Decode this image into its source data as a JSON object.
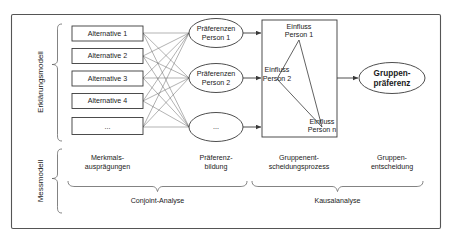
{
  "diagram": {
    "side_labels": {
      "explanation_model": "Erklärungsmodell",
      "measurement_model": "Messmodell"
    },
    "alternatives": [
      {
        "label": "Alternative 1"
      },
      {
        "label": "Alternative 2"
      },
      {
        "label": "Alternative 3"
      },
      {
        "label": "Alternative 4"
      },
      {
        "label": "..."
      }
    ],
    "preferences": [
      {
        "line1": "Präferenzen",
        "line2": "Person 1"
      },
      {
        "line1": "Präferenzen",
        "line2": "Person 2"
      },
      {
        "line1": "...",
        "line2": ""
      }
    ],
    "influence_box": {
      "items": [
        {
          "line1": "Einfluss",
          "line2": "Person 1"
        },
        {
          "line1": "Einfluss",
          "line2": "Person 2"
        },
        {
          "line1": "Einfluss",
          "line2": "Person n"
        }
      ]
    },
    "group_preference": {
      "line1": "Gruppen-",
      "line2": "präferenz"
    },
    "stage_labels": [
      {
        "line1": "Merkmals-",
        "line2": "ausprägungen"
      },
      {
        "line1": "Präferenz-",
        "line2": "bildung"
      },
      {
        "line1": "Gruppenent-",
        "line2": "scheidungsprozess"
      },
      {
        "line1": "Gruppen-",
        "line2": "entscheidung"
      }
    ],
    "method_labels": [
      {
        "label": "Conjoint-Analyse"
      },
      {
        "label": "Kausalanalyse"
      }
    ],
    "colors": {
      "stroke": "#3a3a3a",
      "frame": "#555555",
      "background": "#ffffff",
      "text": "#1a1a1a"
    }
  }
}
